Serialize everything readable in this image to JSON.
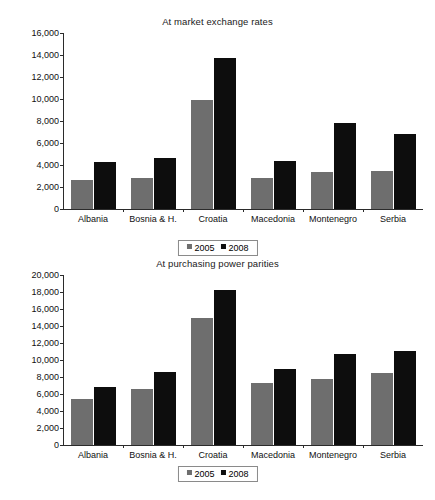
{
  "chart_data": [
    {
      "type": "bar",
      "id": "market-exchange-rates",
      "title": "At market exchange rates",
      "xlabel": "",
      "ylabel": "",
      "ylim": [
        0,
        16000
      ],
      "ytick_step": 2000,
      "grid": false,
      "legend_position": "bottom",
      "categories": [
        "Albania",
        "Bosnia & H.",
        "Croatia",
        "Macedonia",
        "Montenegro",
        "Serbia"
      ],
      "ytick_labels": [
        "0",
        "2,000",
        "4,000",
        "6,000",
        "8,000",
        "10,000",
        "12,000",
        "14,000",
        "16,000"
      ],
      "series": [
        {
          "name": "2005",
          "color": "#6e6e6e",
          "values": [
            2650,
            2850,
            9950,
            2820,
            3400,
            3480
          ]
        },
        {
          "name": "2008",
          "color": "#0d0d0d",
          "values": [
            4250,
            4650,
            13700,
            4320,
            7850,
            6820
          ]
        }
      ]
    },
    {
      "type": "bar",
      "id": "purchasing-power-parities",
      "title": "At purchasing power parities",
      "xlabel": "",
      "ylabel": "",
      "ylim": [
        0,
        20000
      ],
      "ytick_step": 2000,
      "grid": false,
      "legend_position": "bottom",
      "categories": [
        "Albania",
        "Bosnia & H.",
        "Croatia",
        "Macedonia",
        "Montenegro",
        "Serbia"
      ],
      "ytick_labels": [
        "0",
        "2,000",
        "4,000",
        "6,000",
        "8,000",
        "10,000",
        "12,000",
        "14,000",
        "16,000",
        "18,000",
        "20,000"
      ],
      "series": [
        {
          "name": "2005",
          "color": "#6e6e6e",
          "values": [
            5450,
            6550,
            14900,
            7250,
            7800,
            8500
          ]
        },
        {
          "name": "2008",
          "color": "#0d0d0d",
          "values": [
            6850,
            8600,
            18250,
            9000,
            10700,
            11100
          ]
        }
      ]
    }
  ],
  "charts": {
    "top": {
      "title": "At market exchange rates",
      "legend": {
        "items": [
          "2005",
          "2008"
        ]
      }
    },
    "bottom": {
      "title": "At purchasing power parities",
      "legend": {
        "items": [
          "2005",
          "2008"
        ]
      }
    }
  }
}
